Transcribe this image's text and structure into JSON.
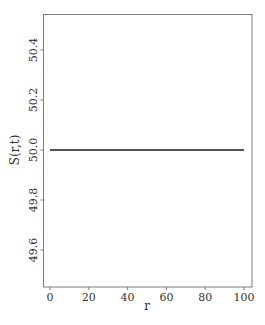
{
  "chart_data": {
    "type": "line",
    "title": "",
    "xlabel": "r",
    "ylabel": "S(r,t)",
    "xlim": [
      -4,
      104
    ],
    "ylim": [
      49.45,
      50.55
    ],
    "xticks": [
      0,
      20,
      40,
      60,
      80,
      100
    ],
    "xtick_labels": [
      "0",
      "20",
      "40",
      "60",
      "80",
      "100"
    ],
    "yticks": [
      49.6,
      49.8,
      50.0,
      50.2,
      50.4
    ],
    "ytick_labels": [
      "49.6",
      "49.8",
      "50.0",
      "50.2",
      "50.4"
    ],
    "grid": false,
    "legend": null,
    "series": [
      {
        "name": "S(r,t)",
        "color": "#1a1a1a",
        "x": [
          0,
          10,
          20,
          30,
          40,
          50,
          60,
          70,
          80,
          90,
          100
        ],
        "y": [
          50.0,
          50.0,
          50.0,
          50.0,
          50.0,
          50.0,
          50.0,
          50.0,
          50.0,
          50.0,
          50.0
        ]
      }
    ]
  },
  "style": {
    "frame_color": "#7a7a7a",
    "line_color": "#1a1a1a",
    "text_color": "#333333"
  }
}
